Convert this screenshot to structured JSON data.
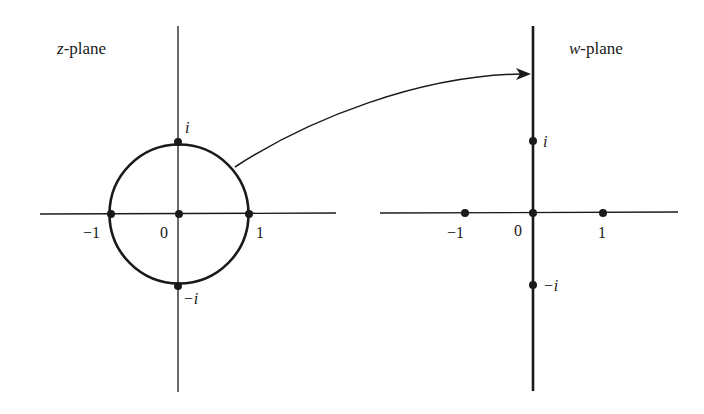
{
  "z_plane": {
    "title_var": "z",
    "title_rest": "-plane",
    "labels": {
      "i": "i",
      "neg_i": "−i",
      "neg_one": "−1",
      "zero": "0",
      "one": "1"
    }
  },
  "w_plane": {
    "title_var": "w",
    "title_rest": "-plane",
    "labels": {
      "i": "i",
      "neg_i": "−i",
      "neg_one": "−1",
      "zero": "0",
      "one": "1"
    }
  },
  "colors": {
    "ink": "#1a1a1a",
    "background": "#ffffff"
  }
}
